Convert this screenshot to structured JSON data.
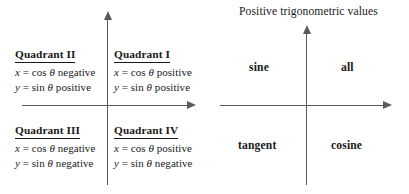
{
  "figure": {
    "background_color": "#ffffff",
    "axis_color": "#5a5a5a",
    "text_color": "#1a1a1a"
  },
  "left_diagram": {
    "name": "quadrant-sign-chart",
    "quadrants": [
      {
        "id": "quadrant-2",
        "title": "Quadrant II",
        "x_line": "x = cos θ negative",
        "y_line": "y = sin θ positive"
      },
      {
        "id": "quadrant-1",
        "title": "Quadrant I",
        "x_line": "x = cos θ positive",
        "y_line": "y = sin θ positive"
      },
      {
        "id": "quadrant-3",
        "title": "Quadrant III",
        "x_line": "x = cos θ negative",
        "y_line": "y = sin θ negative"
      },
      {
        "id": "quadrant-4",
        "title": "Quadrant IV",
        "x_line": "x = cos θ positive",
        "y_line": "y = sin θ negative"
      }
    ]
  },
  "right_diagram": {
    "name": "positive-trig-values-chart",
    "title": "Positive trigonometric values",
    "labels": [
      {
        "id": "quadrant-2-label",
        "text": "sine"
      },
      {
        "id": "quadrant-1-label",
        "text": "all"
      },
      {
        "id": "quadrant-3-label",
        "text": "tangent"
      },
      {
        "id": "quadrant-4-label",
        "text": "cosine"
      }
    ]
  },
  "chart_data": {
    "type": "table",
    "columns": [
      "quadrant",
      "cos θ (x)",
      "sin θ (y)",
      "positive function(s)"
    ],
    "rows": [
      [
        "Quadrant I",
        "positive",
        "positive",
        "all"
      ],
      [
        "Quadrant II",
        "negative",
        "positive",
        "sine"
      ],
      [
        "Quadrant III",
        "negative",
        "negative",
        "tangent"
      ],
      [
        "Quadrant IV",
        "positive",
        "negative",
        "cosine"
      ]
    ],
    "xlabel": "",
    "ylabel": "",
    "grid": false,
    "legend": "none"
  }
}
